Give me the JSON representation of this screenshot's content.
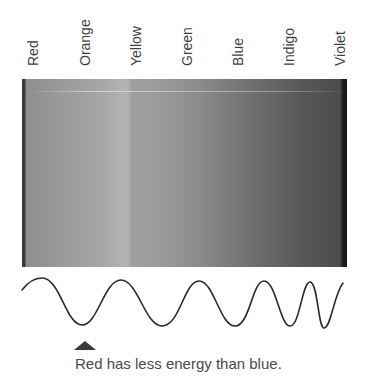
{
  "spectrum": {
    "labels": [
      "Red",
      "Orange",
      "Yellow",
      "Green",
      "Blue",
      "Indigo",
      "Violet"
    ],
    "order": "long wavelength (left) to short wavelength (right)"
  },
  "wave": {
    "description": "sine wave whose wavelength shortens from left (red) to right (violet)",
    "stroke_color": "#2a2a2a"
  },
  "pointer": {
    "icon": "up-triangle-icon",
    "color": "#3a3a3a"
  },
  "caption": "Red has less energy than blue."
}
